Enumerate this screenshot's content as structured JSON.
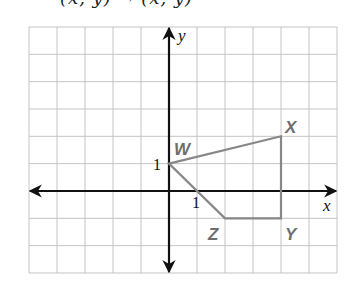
{
  "caption_clipped": "(x, y) → (x, y)",
  "grid": {
    "left": 29,
    "top": 27,
    "cols": 11,
    "rows": 9,
    "cell_w": 28,
    "cell_h": 27.33,
    "origin_col": 5,
    "origin_row": 6,
    "line_color": "#c4c4c4"
  },
  "axes": {
    "x_label": "x",
    "y_label": "y",
    "x_tick_label": "1",
    "y_tick_label": "1",
    "color": "#111111"
  },
  "polygon": {
    "stroke": "#878787",
    "vertices": [
      {
        "name": "W",
        "x": 0,
        "y": 1
      },
      {
        "name": "X",
        "x": 4,
        "y": 2
      },
      {
        "name": "Y",
        "x": 4,
        "y": -1
      },
      {
        "name": "Z",
        "x": 2,
        "y": -1
      }
    ]
  },
  "labels": {
    "W": "W",
    "X": "X",
    "Y": "Y",
    "Z": "Z"
  }
}
